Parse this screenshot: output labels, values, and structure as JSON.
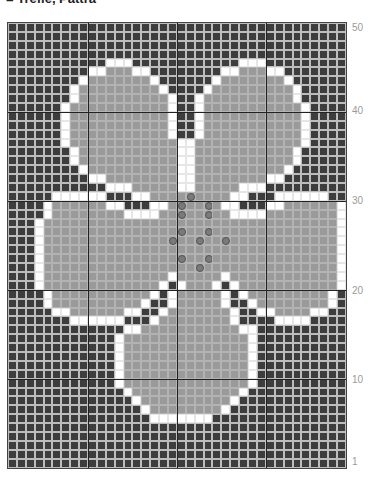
{
  "title": "= Trefle, Pattra",
  "chart": {
    "columns": 38,
    "rows": 50,
    "legend": {
      "D": "background (dark)",
      "W": "outline (white)",
      "G": "fill (grey)",
      "O": "grey with circle symbol"
    },
    "colors": {
      "dark": "#3d3d3d",
      "white": "#ffffff",
      "grey": "#9a9a9a",
      "grid": "#bdbdbd"
    },
    "row_labels": [
      {
        "label": "50",
        "row": 50
      },
      {
        "label": "40",
        "row": 40
      },
      {
        "label": "30",
        "row": 30
      },
      {
        "label": "20",
        "row": 20
      },
      {
        "label": "10",
        "row": 10
      },
      {
        "label": "1",
        "row": 1
      }
    ],
    "pattern_rows_top_to_bottom": [
      "DDDDDDDDDDDDDDDDDDDDDDDDDDDDDDDDDDDDDD",
      "DDDDDDDDDDDDDDDDDDDDDDDDDDDDDDDDDDDDDD",
      "DDDDDDDDDDDDDDDDDDDDDDDDDDDDDDDDDDDDDD",
      "DDDDDDDDDDDDDDDDDDDDDDDDDDDDDDDDDDDDDD",
      "DDDDDDDDDDDWWWDDDDDDDDDDDDWWWDDDDDDDDD",
      "DDDDDDDDDWWGGGWWDDDDDDDDWWGGGWWDDDDDDD",
      "DDDDDDDDWGGGGGGGWDDDDDDWGGGGGGGWDDDDDD",
      "DDDDDDDWGGGGGGGGGWDDDDWGGGGGGGGGWDDDDD",
      "DDDDDDDWGGGGGGGGGGWDDWGGGGGGGGGGWDDDDD",
      "DDDDDDWGGGGGGGGGGGWDDWGGGGGGGGGGGWDDDD",
      "DDDDDDWGGGGGGGGGGGWDDWGGGGGGGGGGGWDDDD",
      "DDDDDDWGGGGGGGGGGGWDDWGGGGGGGGGGGWDDDD",
      "DDDDDDWGGGGGGGGGGGWDDWGGGGGGGGGGGWDDDD",
      "DDDDDDWGGGGGGGGGGGGWWGGGGGGGGGGGGWDDDD",
      "DDDDDDDWGGGGGGGGGGGWWGGGGGGGGGGGWDDDDD",
      "DDDDDDDWGGGGGGGGGGGWWGGGGGGGGGGGWDDDDD",
      "DDDDDDDDWGGGGGGGGGGWWGGGGGGGGGGWDDDDDD",
      "DDDDDDDDDWWGGGGGGGGWWGGGGGGGGWWDDDDDDD",
      "DDDDDDDDDDDWWWGGGGGWWGGGGGWWWDDDDDDDDD",
      "DDDDDWWWWWWDDDWWGGGGOGGGGWWDDDWWWWWWDDD",
      "DDDDWGGGGGGWWDDDWWGOGGOGWWDDDWWGGGGGGWDD",
      "DDDDWGGGGGGGGWWWWGGOGGOGGWWWWGGGGGGGGWDD",
      "DDDWGGGGGGGGGGGGGGGGGGGGGGGGGGGGGGGGGWD",
      "DDDWGGGGGGGGGGGGGGGOGGOGGGGGGGGGGGGGGWD",
      "DDDWGGGGGGGGGGGGGGOGGOGGOGGGGGGGGGGGGWD",
      "DDDWGGGGGGGGGGGGGGGGGGGGGGGGGGGGGGGGGWD",
      "DDDWGGGGGGGGGGGGGGGOGGOGGGGGGGGGGGGGGWD",
      "DDDWGGGGGGGGGGGGGGGGGOGGGGGGGGGGGGGGGWD",
      "DDDWGGGGGGGGGGGGGGWGGGGGWGGGGGGGGGGGGWD",
      "DDDWGGGGGGGGGGGGGWDWGGGWDWGGGGGGGGGGGWD",
      "DDDDWGGGGGGGGGGGWDWGGGGGWDWGGGGGGGGGWDD",
      "DDDDWGGGGGGGGGGWDDWGGGGGWDDWGGGGGGGGWDD",
      "DDDDDWWGGGGGGWWDDWGGGGGGGWDDWWGGGGWWDDD",
      "DDDDDDDWWWWWWDDDWGGGGGGGGWDDDDWWWWDDDDD",
      "DDDDDDDDDDDDDWWGGGGGGGGGGGWWDDDDDDDDDDD",
      "DDDDDDDDDDDDWGGGGGGGGGGGGGGWDDDDDDDDDDD",
      "DDDDDDDDDDDDWGGGGGGGGGGGGGGWDDDDDDDDDDD",
      "DDDDDDDDDDDDWGGGGGGGGGGGGGGWDDDDDDDDDDD",
      "DDDDDDDDDDDDWGGGGGGGGGGGGGGWDDDDDDDDDDD",
      "DDDDDDDDDDDDWGGGGGGGGGGGGGGWDDDDDDDDDDD",
      "DDDDDDDDDDDDWGGGGGGGGGGGGGGWDDDDDDDDDDD",
      "DDDDDDDDDDDDDWGGGGGGGGGGGGWDDDDDDDDDDDD",
      "DDDDDDDDDDDDDDWGGGGGGGGGGWDDDDDDDDDDDDD",
      "DDDDDDDDDDDDDDDWGGGGGGGGWDDDDDDDDDDDDDD",
      "DDDDDDDDDDDDDDDDWWWWWWWDDDDDDDDDDDDDDDD",
      "DDDDDDDDDDDDDDDDDDDDDDDDDDDDDDDDDDDDDD",
      "DDDDDDDDDDDDDDDDDDDDDDDDDDDDDDDDDDDDDD",
      "DDDDDDDDDDDDDDDDDDDDDDDDDDDDDDDDDDDDDD",
      "DDDDDDDDDDDDDDDDDDDDDDDDDDDDDDDDDDDDDD",
      "DDDDDDDDDDDDDDDDDDDDDDDDDDDDDDDDDDDDDD"
    ]
  }
}
